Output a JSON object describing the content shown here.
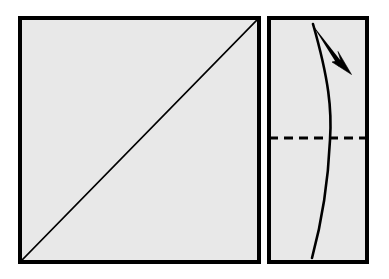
{
  "figure": {
    "title": "Paper folding diagram",
    "description": "Two-panel origami instruction: a square sheet with a diagonal crease, and a folded rectangle with a horizontal dashed crease, a curved edge and a folding arrow.",
    "background_color": "#ffffff",
    "paper_fill_color": "#e8e8e8",
    "ink_color": "#000000"
  },
  "panels": [
    {
      "id": "left-panel",
      "name": "square-sheet",
      "label": "Square sheet with diagonal crease",
      "shape": "square",
      "x": 20,
      "y": 18,
      "width": 239,
      "height": 244,
      "fill": "#e8e8e8",
      "stroke": "#000000",
      "stroke_width": 3.2,
      "marks": [
        {
          "id": "diagonal-crease",
          "name": "diagonal-crease-line",
          "label": "Diagonal crease line",
          "type": "solid-line",
          "x1": 22,
          "y1": 260,
          "x2": 257,
          "y2": 20,
          "stroke": "#000000",
          "stroke_width": 1.6
        }
      ]
    },
    {
      "id": "right-panel",
      "name": "folded-rectangle",
      "label": "Folded rectangle with horizontal crease",
      "shape": "rectangle",
      "x": 269,
      "y": 18,
      "width": 98,
      "height": 244,
      "fill": "#e8e8e8",
      "stroke": "#000000",
      "stroke_width": 3.2,
      "marks": [
        {
          "id": "horizontal-crease",
          "name": "dashed-crease-line",
          "label": "Horizontal dashed crease line",
          "type": "dashed-line",
          "x1": 269,
          "y1": 138,
          "x2": 367,
          "y2": 138,
          "stroke": "#000000",
          "stroke_width": 3.0,
          "dash_pattern": "9 6"
        },
        {
          "id": "curved-edge",
          "name": "curved-edge-line",
          "label": "Curved paper edge",
          "type": "curve",
          "path": "M 313 24 C 329 80 332 110 330 140 C 328 185 321 225 312 258",
          "stroke": "#000000",
          "stroke_width": 2.6,
          "fill": "none"
        },
        {
          "id": "fold-arrow",
          "name": "fold-direction-arrow",
          "label": "Fold direction arrow",
          "type": "arrow",
          "tail_x": 312,
          "tail_y": 24,
          "tip_x": 349,
          "tip_y": 72,
          "direction": "down-right",
          "fill": "#000000"
        }
      ]
    }
  ],
  "legend": {
    "solid_line_meaning": "Edge or existing crease",
    "dashed_line_meaning": "Valley fold line",
    "arrow_meaning": "Fold in the direction of the arrow"
  }
}
